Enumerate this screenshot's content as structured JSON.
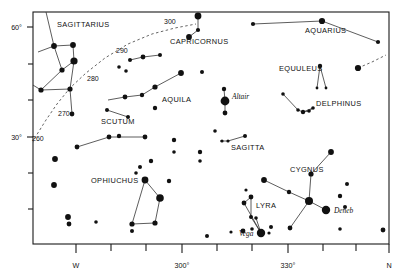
{
  "chart_data": {
    "type": "scatter",
    "title": "",
    "xlabel": "",
    "ylabel": "",
    "grid": false,
    "legend": null,
    "plot_box": {
      "x": 33,
      "y": 12,
      "width": 356,
      "height": 232
    },
    "x_axis": {
      "name": "azimuth",
      "range": [
        255,
        360
      ],
      "tick_labels": [
        {
          "text": "W",
          "x": 76
        },
        {
          "text": "300°",
          "x": 182
        },
        {
          "text": "330°",
          "x": 288
        },
        {
          "text": "N",
          "x": 388
        }
      ],
      "tick_positions": [
        76,
        111,
        146,
        182,
        217,
        252,
        288,
        323,
        353,
        388
      ]
    },
    "y_axis": {
      "name": "altitude",
      "range": [
        0,
        70
      ],
      "tick_labels": [
        {
          "text": "60°",
          "y": 27
        },
        {
          "text": "30°",
          "y": 137
        }
      ],
      "tick_positions": [
        27,
        64,
        100,
        137,
        173,
        209
      ]
    },
    "ecliptic": {
      "label": "ecliptic",
      "degree_labels": [
        {
          "text": "260",
          "x": 32,
          "y": 141
        },
        {
          "text": "270",
          "x": 58,
          "y": 116
        },
        {
          "text": "280",
          "x": 87,
          "y": 81
        },
        {
          "text": "290",
          "x": 116,
          "y": 53
        },
        {
          "text": "300",
          "x": 164,
          "y": 24
        }
      ],
      "path_main": "M 28,152 L 36,136 L 46,120 L 57,104 L 70,88 L 86,73 L 105,58 L 128,44 L 152,34 L 175,28 L 196,24",
      "path_right": "M 358,68 L 372,62 L 386,55"
    },
    "constellations": [
      {
        "name": "SAGITTARIUS",
        "label": {
          "x": 57,
          "y": 27
        },
        "stars": [
          {
            "x": 54,
            "y": 46,
            "r": 2.9
          },
          {
            "x": 73,
            "y": 45,
            "r": 2.9
          },
          {
            "x": 74,
            "y": 61,
            "r": 3.6
          },
          {
            "x": 62,
            "y": 70,
            "r": 2.6
          },
          {
            "x": 41,
            "y": 90,
            "r": 2.6
          },
          {
            "x": 70,
            "y": 89,
            "r": 2.6
          },
          {
            "x": 72,
            "y": 114,
            "r": 2.4
          },
          {
            "x": 46,
            "y": 14,
            "r": 0
          }
        ],
        "lines": [
          "M 54,46 L 73,45 L 74,61 L 62,70 L 54,46",
          "M 62,70 L 41,90 L 70,89 L 74,61",
          "M 70,89 L 72,114",
          "M 54,46 L 46,12",
          "M 41,90 L 28,82",
          "M 54,46 L 38,52"
        ]
      },
      {
        "name": "CAPRICORNUS",
        "label": {
          "x": 170,
          "y": 44
        },
        "stars": [
          {
            "x": 198,
            "y": 16,
            "r": 3.4
          },
          {
            "x": 198,
            "y": 30,
            "r": 2.1
          },
          {
            "x": 189,
            "y": 37,
            "r": 2.9
          }
        ],
        "lines": [
          "M 198,16 L 198,30 L 189,37"
        ]
      },
      {
        "name": "AQUARIUS",
        "label": {
          "x": 305,
          "y": 33
        },
        "stars": [
          {
            "x": 253,
            "y": 24,
            "r": 2.1
          },
          {
            "x": 322,
            "y": 21,
            "r": 3.1
          },
          {
            "x": 378,
            "y": 42,
            "r": 2.1
          }
        ],
        "lines": [
          "M 253,24 L 322,21 L 378,42"
        ]
      },
      {
        "name": "EQUULEUS",
        "label": {
          "x": 279,
          "y": 71
        },
        "stars": [
          {
            "x": 320,
            "y": 66,
            "r": 2.2
          },
          {
            "x": 317,
            "y": 88,
            "r": 1.4
          },
          {
            "x": 326,
            "y": 88,
            "r": 1.4
          }
        ],
        "lines": [
          "M 320,66 L 317,88",
          "M 320,66 L 326,88"
        ]
      },
      {
        "name": "DELPHINUS",
        "label": {
          "x": 316,
          "y": 106
        },
        "stars": [
          {
            "x": 283,
            "y": 94,
            "r": 1.8
          },
          {
            "x": 298,
            "y": 110,
            "r": 1.8
          },
          {
            "x": 303,
            "y": 112,
            "r": 2.2
          },
          {
            "x": 309,
            "y": 111,
            "r": 1.8
          },
          {
            "x": 313,
            "y": 108,
            "r": 1.8
          }
        ],
        "lines": [
          "M 283,94 L 298,110 L 303,112 L 309,111 L 313,108 L 303,112"
        ]
      },
      {
        "name": "AQUILA",
        "label": {
          "x": 162,
          "y": 102
        },
        "stars": [
          {
            "x": 125,
            "y": 97,
            "r": 2.4
          },
          {
            "x": 142,
            "y": 95,
            "r": 2.2
          },
          {
            "x": 155,
            "y": 87,
            "r": 2.6
          },
          {
            "x": 181,
            "y": 73,
            "r": 2.9
          },
          {
            "x": 155,
            "y": 108,
            "r": 2.2
          },
          {
            "x": 224,
            "y": 89,
            "r": 2.2
          },
          {
            "x": 225,
            "y": 101,
            "r": 4.4
          },
          {
            "x": 225,
            "y": 113,
            "r": 2.4
          },
          {
            "x": 174,
            "y": 140,
            "r": 2.2
          },
          {
            "x": 174,
            "y": 152,
            "r": 1.8
          }
        ],
        "lines": [
          "M 108,100 L 125,97 L 142,95 L 155,87 L 181,73",
          "M 224,89 L 225,101 L 225,113"
        ]
      },
      {
        "name": "SCUTUM",
        "label": {
          "x": 101,
          "y": 124
        },
        "stars": [
          {
            "x": 107,
            "y": 110,
            "r": 2.0
          },
          {
            "x": 128,
            "y": 117,
            "r": 2.0
          },
          {
            "x": 119,
            "y": 136,
            "r": 2.2
          }
        ],
        "lines": [
          "M 107,110 L 128,117"
        ]
      },
      {
        "name": "SAGITTA",
        "label": {
          "x": 231,
          "y": 150
        },
        "stars": [
          {
            "x": 222,
            "y": 141,
            "r": 1.6
          },
          {
            "x": 228,
            "y": 141,
            "r": 1.6
          },
          {
            "x": 245,
            "y": 136,
            "r": 2.0
          }
        ],
        "lines": [
          "M 220,141 L 228,141 L 245,136"
        ]
      },
      {
        "name": "CYGNUS",
        "label": {
          "x": 290,
          "y": 172
        },
        "stars": [
          {
            "x": 264,
            "y": 180,
            "r": 2.9
          },
          {
            "x": 289,
            "y": 192,
            "r": 2.2
          },
          {
            "x": 309,
            "y": 201,
            "r": 4.0
          },
          {
            "x": 311,
            "y": 174,
            "r": 2.6
          },
          {
            "x": 331,
            "y": 152,
            "r": 2.9
          },
          {
            "x": 326,
            "y": 210,
            "r": 4.2
          },
          {
            "x": 290,
            "y": 228,
            "r": 2.4
          }
        ],
        "lines": [
          "M 264,180 L 289,192 L 309,201 L 311,174 L 331,152",
          "M 309,201 L 326,210",
          "M 309,201 L 290,228"
        ]
      },
      {
        "name": "LYRA",
        "label": {
          "x": 256,
          "y": 208
        },
        "stars": [
          {
            "x": 251,
            "y": 197,
            "r": 2.4
          },
          {
            "x": 244,
            "y": 203,
            "r": 2.4
          },
          {
            "x": 251,
            "y": 217,
            "r": 2.0
          },
          {
            "x": 256,
            "y": 218,
            "r": 1.8
          },
          {
            "x": 261,
            "y": 233,
            "r": 4.2
          },
          {
            "x": 269,
            "y": 233,
            "r": 1.6
          }
        ],
        "lines": [
          "M 251,197 L 244,203 L 261,233 L 251,217 L 251,197",
          "M 256,218 L 261,233"
        ]
      },
      {
        "name": "OPHIUCHUS",
        "label": {
          "x": 91,
          "y": 183
        },
        "stars": [
          {
            "x": 145,
            "y": 180,
            "r": 3.4
          },
          {
            "x": 160,
            "y": 198,
            "r": 3.8
          },
          {
            "x": 155,
            "y": 223,
            "r": 2.6
          },
          {
            "x": 132,
            "y": 224,
            "r": 2.6
          },
          {
            "x": 132,
            "y": 231,
            "r": 2.0
          },
          {
            "x": 140,
            "y": 167,
            "r": 2.0
          },
          {
            "x": 151,
            "y": 161,
            "r": 2.2
          },
          {
            "x": 136,
            "y": 173,
            "r": 1.8
          }
        ],
        "lines": [
          "M 145,180 L 160,198 L 155,223 L 132,224 L 145,180"
        ]
      }
    ],
    "named_stars": [
      {
        "name": "Altair",
        "x": 225,
        "y": 101,
        "label_x": 232,
        "label_y": 99
      },
      {
        "name": "Deneb",
        "x": 326,
        "y": 210,
        "label_x": 334,
        "label_y": 213
      },
      {
        "name": "Vega",
        "x": 261,
        "y": 233,
        "label_x": 239,
        "label_y": 236
      }
    ],
    "field_stars": [
      {
        "x": 77,
        "y": 147,
        "r": 2.4
      },
      {
        "x": 109,
        "y": 137,
        "r": 2.4
      },
      {
        "x": 145,
        "y": 137,
        "r": 2.4
      },
      {
        "x": 55,
        "y": 159,
        "r": 2.9
      },
      {
        "x": 54,
        "y": 185,
        "r": 2.9
      },
      {
        "x": 68,
        "y": 217,
        "r": 2.9
      },
      {
        "x": 69,
        "y": 224,
        "r": 2.4
      },
      {
        "x": 96,
        "y": 222,
        "r": 1.8
      },
      {
        "x": 169,
        "y": 181,
        "r": 2.2
      },
      {
        "x": 202,
        "y": 72,
        "r": 2.0
      },
      {
        "x": 215,
        "y": 131,
        "r": 1.8
      },
      {
        "x": 246,
        "y": 190,
        "r": 1.6
      },
      {
        "x": 243,
        "y": 231,
        "r": 2.4
      },
      {
        "x": 252,
        "y": 229,
        "r": 1.8
      },
      {
        "x": 231,
        "y": 232,
        "r": 1.6
      },
      {
        "x": 271,
        "y": 227,
        "r": 2.0
      },
      {
        "x": 347,
        "y": 184,
        "r": 2.0
      },
      {
        "x": 340,
        "y": 196,
        "r": 2.2
      },
      {
        "x": 345,
        "y": 207,
        "r": 2.0
      },
      {
        "x": 358,
        "y": 68,
        "r": 3.1
      },
      {
        "x": 340,
        "y": 229,
        "r": 1.8
      },
      {
        "x": 207,
        "y": 236,
        "r": 2.0
      },
      {
        "x": 130,
        "y": 60,
        "r": 2.0
      },
      {
        "x": 143,
        "y": 57,
        "r": 2.4
      },
      {
        "x": 160,
        "y": 55,
        "r": 2.0
      },
      {
        "x": 119,
        "y": 67,
        "r": 1.8
      },
      {
        "x": 126,
        "y": 71,
        "r": 1.8
      },
      {
        "x": 383,
        "y": 230,
        "r": 2.4
      },
      {
        "x": 200,
        "y": 152,
        "r": 2.2
      },
      {
        "x": 200,
        "y": 161,
        "r": 1.8
      }
    ],
    "extra_lines": [
      "M 130,60 L 143,57 L 160,55",
      "M 77,147 L 109,137",
      "M 109,137 L 145,137"
    ]
  },
  "axis_labels": {
    "y_top": "60°",
    "y_mid": "30°",
    "x_w": "W",
    "x_300": "300°",
    "x_330": "330°",
    "x_n": "N"
  },
  "constellation_names": {
    "sagittarius": "SAGITTARIUS",
    "capricornus": "CAPRICORNUS",
    "aquarius": "AQUARIUS",
    "equuleus": "EQUULEUS",
    "delphinus": "DELPHINUS",
    "aquila": "AQUILA",
    "scutum": "SCUTUM",
    "sagitta": "SAGITTA",
    "cygnus": "CYGNUS",
    "lyra": "LYRA",
    "ophiuchus": "OPHIUCHUS"
  },
  "star_names": {
    "altair": "Altair",
    "deneb": "Deneb",
    "vega": "Vega"
  },
  "ecliptic_degrees": {
    "d260": "260",
    "d270": "270",
    "d280": "280",
    "d290": "290",
    "d300": "300"
  },
  "colors": {
    "ink": "#111111",
    "frame": "#1a1a1a",
    "ecliptic": "#555555",
    "background": "#ffffff"
  }
}
